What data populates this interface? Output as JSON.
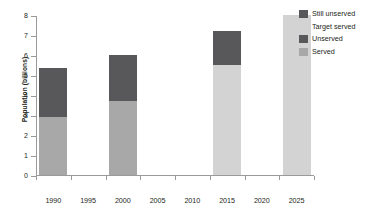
{
  "chart_data": {
    "type": "bar",
    "title": "",
    "xlabel": "",
    "ylabel": "Population (billions)",
    "ylim": [
      0,
      8
    ],
    "ytick_labels": [
      "8",
      "7",
      "6",
      "5",
      "4",
      "3",
      "2",
      "1",
      "0"
    ],
    "ytick_values": [
      8,
      7,
      6,
      5,
      4,
      3,
      2,
      1,
      0
    ],
    "categories": [
      "1990",
      "1995",
      "2000",
      "2005",
      "2010",
      "2015",
      "2020",
      "2025"
    ],
    "grid": false,
    "legend_position": "right",
    "stacked": true,
    "series": [
      {
        "name": "Served",
        "color": "#a8a8a8",
        "values": [
          2.9,
          null,
          3.7,
          null,
          null,
          null,
          null,
          null
        ]
      },
      {
        "name": "Unserved",
        "color": "#58585a",
        "values": [
          2.45,
          null,
          2.3,
          null,
          null,
          null,
          null,
          null
        ]
      },
      {
        "name": "Target served",
        "color": "#d3d3d3",
        "values": [
          null,
          null,
          null,
          null,
          null,
          5.5,
          null,
          8.0
        ]
      },
      {
        "name": "Still unserved",
        "color": "#58585a",
        "values": [
          null,
          null,
          null,
          null,
          null,
          1.7,
          null,
          null
        ]
      }
    ],
    "bars": [
      {
        "category": "1990",
        "total": 5.35,
        "segments": [
          {
            "series": "Served",
            "value": 2.9,
            "color": "#a8a8a8"
          },
          {
            "series": "Unserved",
            "value": 2.45,
            "color": "#58585a"
          }
        ]
      },
      {
        "category": "1995",
        "total": 0,
        "segments": []
      },
      {
        "category": "2000",
        "total": 6.0,
        "segments": [
          {
            "series": "Served",
            "value": 3.7,
            "color": "#a8a8a8"
          },
          {
            "series": "Unserved",
            "value": 2.3,
            "color": "#58585a"
          }
        ]
      },
      {
        "category": "2005",
        "total": 0,
        "segments": []
      },
      {
        "category": "2010",
        "total": 0,
        "segments": []
      },
      {
        "category": "2015",
        "total": 7.2,
        "segments": [
          {
            "series": "Target served",
            "value": 5.5,
            "color": "#d3d3d3"
          },
          {
            "series": "Still unserved",
            "value": 1.7,
            "color": "#58585a"
          }
        ]
      },
      {
        "category": "2020",
        "total": 0,
        "segments": []
      },
      {
        "category": "2025",
        "total": 8.0,
        "segments": [
          {
            "series": "Target served",
            "value": 8.0,
            "color": "#d3d3d3"
          }
        ]
      }
    ],
    "legend": [
      {
        "label": "Still unserved",
        "color": "#58585a"
      },
      {
        "label": "Target served",
        "color": "#d3d3d3"
      },
      {
        "label": "Unserved",
        "color": "#58585a"
      },
      {
        "label": "Served",
        "color": "#a8a8a8"
      }
    ]
  },
  "colors": {
    "axis": "#9a9a9a",
    "text": "#231f20",
    "background": "#ffffff"
  }
}
